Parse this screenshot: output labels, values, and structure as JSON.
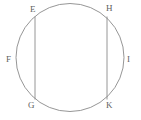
{
  "figure": {
    "background_color": "#ffffff",
    "stroke_color": "#8a8a8a",
    "label_color": "#5f5f5f",
    "stroke_width": 0.9,
    "canvas": {
      "width": 141,
      "height": 120
    },
    "circle": {
      "name": "circle",
      "cx": 70,
      "cy": 57.5,
      "r": 54
    },
    "chords": [
      {
        "name": "chord-EG",
        "from_label": "E",
        "to_label": "G",
        "x1": 35,
        "y1": 16.5,
        "x2": 35,
        "y2": 99.5
      },
      {
        "name": "chord-HK",
        "from_label": "H",
        "to_label": "K",
        "x1": 107,
        "y1": 16.5,
        "x2": 107,
        "y2": 99.5
      }
    ],
    "labels": [
      {
        "name": "label-E",
        "text": "E",
        "x": 30,
        "y": 5
      },
      {
        "name": "label-H",
        "text": "H",
        "x": 106,
        "y": 4
      },
      {
        "name": "label-F",
        "text": "F",
        "x": 6,
        "y": 55
      },
      {
        "name": "label-I",
        "text": "I",
        "x": 127,
        "y": 55
      },
      {
        "name": "label-G",
        "text": "G",
        "x": 28,
        "y": 101
      },
      {
        "name": "label-K",
        "text": "K",
        "x": 106,
        "y": 101
      }
    ]
  }
}
